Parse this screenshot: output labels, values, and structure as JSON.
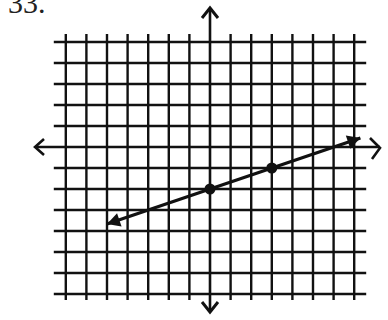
{
  "problem_label": "33.",
  "chart_data": {
    "type": "line",
    "title": "",
    "xlabel": "",
    "ylabel": "",
    "xlim": [
      -7,
      7
    ],
    "ylim": [
      -7,
      5
    ],
    "grid": true,
    "axis_arrows": true,
    "series": [
      {
        "name": "line",
        "equation": "y = (1/3)x - 2",
        "slope": 0.3333,
        "intercept": -2,
        "marked_points": [
          [
            0,
            -2
          ],
          [
            3,
            -1
          ]
        ],
        "arrow_ends": [
          [
            -5,
            -3.67
          ],
          [
            7.3,
            0.43
          ]
        ]
      }
    ]
  }
}
